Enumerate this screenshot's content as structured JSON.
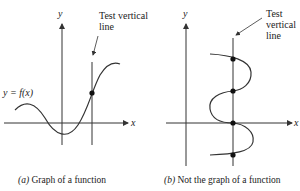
{
  "panel_a": {
    "y_axis_label": "y",
    "x_axis_label": "x",
    "function_label": "y = f(x)",
    "test_line_label_line1": "Test vertical",
    "test_line_label_line2": "line",
    "caption_letter": "(a)",
    "caption_text": " Graph of a function",
    "intersection_points": 1
  },
  "panel_b": {
    "y_axis_label": "y",
    "x_axis_label": "x",
    "test_line_label_line1": "Test",
    "test_line_label_line2": "vertical",
    "test_line_label_line3": "line",
    "caption_letter": "(b)",
    "caption_text": " Not the graph of a function",
    "intersection_points": 4
  },
  "colors": {
    "stroke": "#333333",
    "background": "#ffffff"
  }
}
